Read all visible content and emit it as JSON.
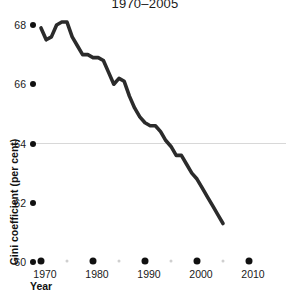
{
  "chart_data": {
    "type": "line",
    "title": "1970–2005",
    "xlabel": "Year",
    "ylabel": "Gini coefficient (per cent)",
    "xlim": [
      1970,
      2010
    ],
    "ylim": [
      60,
      68
    ],
    "ytick_values": [
      68,
      66,
      64,
      62,
      60
    ],
    "ytick_labels": [
      "68",
      "66",
      "64",
      "62",
      "60"
    ],
    "xtick_values": [
      1970,
      1980,
      1990,
      2000,
      2010
    ],
    "xtick_labels": [
      "1970",
      "1980",
      "1990",
      "2000",
      "2010"
    ],
    "xminor_values": [
      1975,
      1985,
      1995,
      2005
    ],
    "grid": "single horizontal gridline at y = 64",
    "gridline_value": 64,
    "legend": "none",
    "series": [
      {
        "name": "Gini coefficient",
        "color": "#2b2b2b",
        "x": [
          1970,
          1971,
          1972,
          1973,
          1974,
          1975,
          1976,
          1977,
          1978,
          1979,
          1980,
          1981,
          1982,
          1983,
          1984,
          1985,
          1986,
          1987,
          1988,
          1989,
          1990,
          1991,
          1992,
          1993,
          1994,
          1995,
          1996,
          1997,
          1998,
          1999,
          2000,
          2001,
          2002,
          2003,
          2004,
          2005
        ],
        "values": [
          67.9,
          67.5,
          67.6,
          68.0,
          68.1,
          68.1,
          67.6,
          67.3,
          67.0,
          67.0,
          66.9,
          66.9,
          66.8,
          66.4,
          66.0,
          66.2,
          66.1,
          65.6,
          65.2,
          64.9,
          64.7,
          64.6,
          64.6,
          64.4,
          64.1,
          63.9,
          63.6,
          63.6,
          63.3,
          63.0,
          62.8,
          62.5,
          62.2,
          61.9,
          61.6,
          61.3
        ]
      }
    ]
  }
}
